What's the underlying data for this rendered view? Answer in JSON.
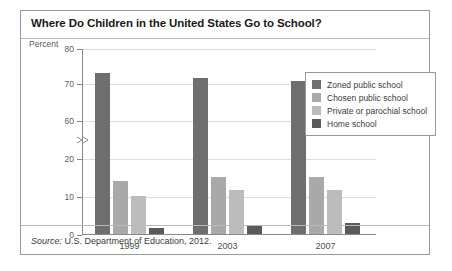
{
  "figure": {
    "title": "Where Do Children in the United States Go to School?",
    "source_prefix": "Source:",
    "source_text": " U.S. Department of Education, 2012."
  },
  "chart_data": {
    "type": "bar",
    "title": "Where Do Children in the United States Go to School?",
    "xlabel": "",
    "ylabel": "Percent",
    "categories": [
      "1999",
      "2003",
      "2007"
    ],
    "series": [
      {
        "name": "Zoned public school",
        "color": "#6e6e6e",
        "values": [
          73.0,
          71.5,
          70.5
        ]
      },
      {
        "name": "Chosen public school",
        "color": "#a9a9a9",
        "values": [
          14.0,
          15.0,
          15.0
        ]
      },
      {
        "name": "Private or parochial school",
        "color": "#bcbcbc",
        "values": [
          10.0,
          11.5,
          11.5
        ]
      },
      {
        "name": "Home school",
        "color": "#5a5a5a",
        "values": [
          1.7,
          2.4,
          3.0
        ]
      }
    ],
    "ytick_labels": [
      "80",
      "70",
      "60",
      "20",
      "10",
      "0"
    ],
    "ytick_values": [
      80,
      70,
      60,
      20,
      10,
      0
    ],
    "axis_break": {
      "between": [
        60,
        20
      ],
      "label": "axis-break"
    },
    "ylim": [
      0,
      80
    ],
    "grid": true,
    "legend_position": "upper right"
  },
  "legend": {
    "items": [
      {
        "label": "Zoned public school",
        "color": "#6e6e6e"
      },
      {
        "label": "Chosen public school",
        "color": "#a9a9a9"
      },
      {
        "label": "Private or parochial school",
        "color": "#bcbcbc"
      },
      {
        "label": "Home school",
        "color": "#5a5a5a"
      }
    ]
  }
}
